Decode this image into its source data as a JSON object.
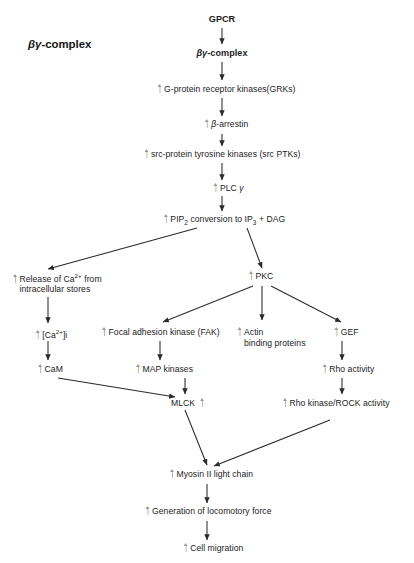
{
  "diagram": {
    "side_title": "βγ-complex",
    "nodes": {
      "gpcr": "GPCR",
      "bg_complex": "βγ-complex",
      "grks": "G-protein receptor kinases(GRKs)",
      "arrestin": "β-arrestin",
      "src_ptks": "src-protein tyrosine kinases (src PTKs)",
      "plc_gamma": "PLC γ",
      "pip2": "PIP2 conversion to IP3 + DAG",
      "pip2_parts": {
        "a": "PIP",
        "sub1": "2",
        "b": " conversion to IP",
        "sub2": "3",
        "c": " + DAG"
      },
      "ca_release_line1": "Release of Ca2+ from",
      "ca_release_line1_parts": {
        "a": "Release of Ca",
        "sup": "2+",
        "b": " from"
      },
      "ca_release_line2": "intracellular stores",
      "pkc": "PKC",
      "ca_i": "[Ca2+]i",
      "ca_i_parts": {
        "a": "[Ca",
        "sup": "2+",
        "b": "]i"
      },
      "cam": "CaM",
      "fak": "Focal adhesion kinase (FAK)",
      "map_kinases": "MAP kinases",
      "actin_line1": "Actin",
      "actin_line2": "binding proteins",
      "gef": "GEF",
      "rho_activity": "Rho activity",
      "mlck": "MLCK",
      "rock": "Rho kinase/ROCK activity",
      "myosin": "Myosin II light chain",
      "locomotory": "Generation of locomotory force",
      "cell_migration": "Cell migration"
    },
    "colors": {
      "text": "#1b1b1b",
      "edge": "#2a2a2a",
      "upregulation_arrow": "#b0b0b0",
      "background": "#ffffff"
    }
  }
}
